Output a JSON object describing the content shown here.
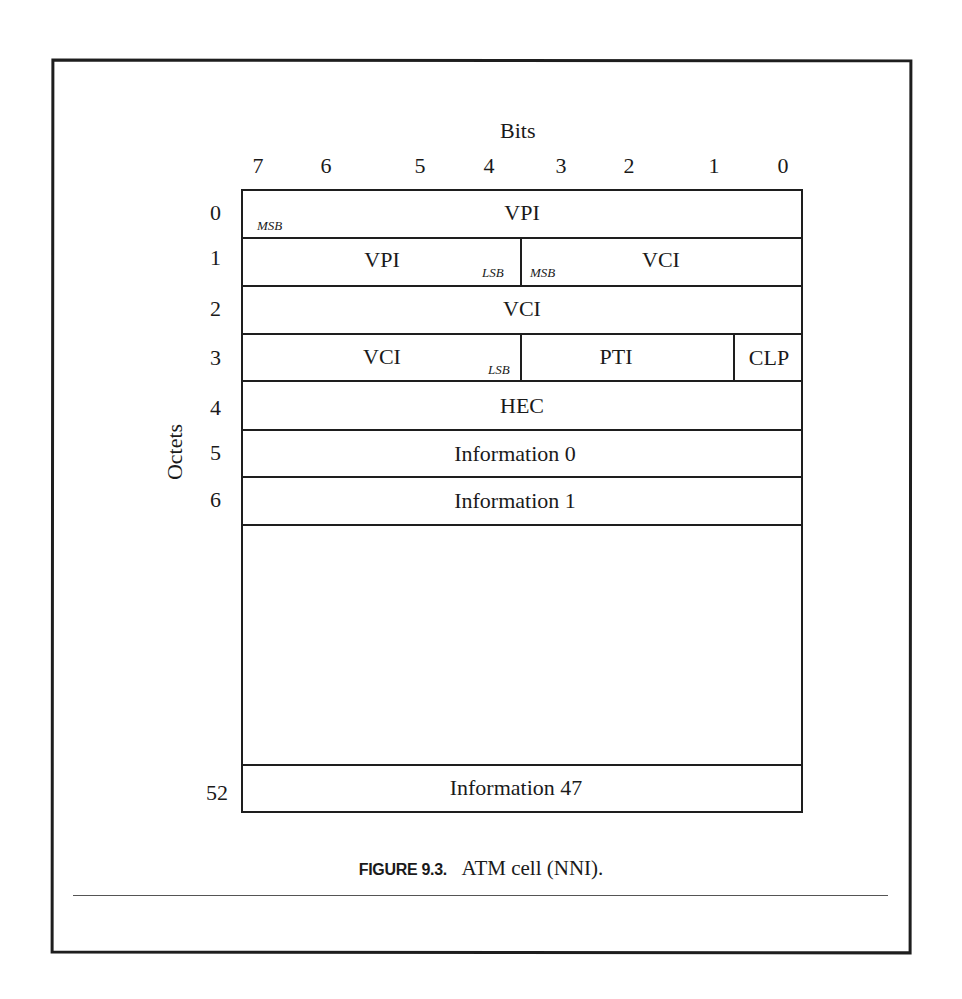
{
  "figure": {
    "caption_label": "FIGURE 9.3.",
    "caption_text": "ATM cell (NNI)."
  },
  "axes": {
    "bits_title": "Bits",
    "octets_title": "Octets",
    "bit_labels": [
      "7",
      "6",
      "5",
      "4",
      "3",
      "2",
      "1",
      "0"
    ],
    "octet_labels": [
      "0",
      "1",
      "2",
      "3",
      "4",
      "5",
      "6",
      "52"
    ]
  },
  "rows": [
    {
      "octet": "0",
      "fields": [
        {
          "label": "VPI",
          "span_bits": 8,
          "note_left": "MSB"
        }
      ]
    },
    {
      "octet": "1",
      "fields": [
        {
          "label": "VPI",
          "span_bits": 4,
          "note_right": "LSB"
        },
        {
          "label": "VCI",
          "span_bits": 4,
          "note_left": "MSB"
        }
      ]
    },
    {
      "octet": "2",
      "fields": [
        {
          "label": "VCI",
          "span_bits": 8
        }
      ]
    },
    {
      "octet": "3",
      "fields": [
        {
          "label": "VCI",
          "span_bits": 4,
          "note_right": "LSB"
        },
        {
          "label": "PTI",
          "span_bits": 3
        },
        {
          "label": "CLP",
          "span_bits": 1
        }
      ]
    },
    {
      "octet": "4",
      "fields": [
        {
          "label": "HEC",
          "span_bits": 8
        }
      ]
    },
    {
      "octet": "5",
      "fields": [
        {
          "label": "Information 0",
          "span_bits": 8
        }
      ]
    },
    {
      "octet": "6",
      "fields": [
        {
          "label": "Information 1",
          "span_bits": 8
        }
      ]
    },
    {
      "octet": "",
      "fields": [
        {
          "label": "",
          "span_bits": 8,
          "ellipsis_gap": true
        }
      ]
    },
    {
      "octet": "52",
      "fields": [
        {
          "label": "Information 47",
          "span_bits": 8
        }
      ]
    }
  ],
  "notes": {
    "msb": "MSB",
    "lsb": "LSB"
  },
  "colors": {
    "line": "#1e1e1e",
    "text": "#1a1a1a",
    "background": "#ffffff",
    "rule": "#555555"
  }
}
